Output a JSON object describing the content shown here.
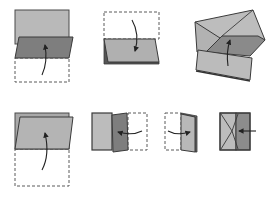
{
  "diagram": {
    "colors": {
      "paper_light": "#b9b9b9",
      "paper_mid": "#a9a9a9",
      "paper_dark": "#7e7e7e",
      "outline": "#3a3a3a",
      "dashed": "#5a5a5a",
      "arrow": "#222222",
      "background": "#ffffff"
    },
    "steps": [
      {
        "id": 1,
        "description": "Fold bottom half up (valley fold) over top half"
      },
      {
        "id": 2,
        "description": "Fold top half down over bottom"
      },
      {
        "id": 3,
        "description": "Open and squash into envelope/pocket shape"
      },
      {
        "id": 4,
        "description": "Fold bottom edge up along dashed outline"
      },
      {
        "id": 5,
        "description": "Fold right panel to the left"
      },
      {
        "id": 6,
        "description": "Fold left panel to the right"
      },
      {
        "id": 7,
        "description": "Push in center to form final fold"
      }
    ]
  }
}
